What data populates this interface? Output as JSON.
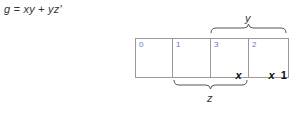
{
  "equation": "g = xy + yz'",
  "kmap": {
    "cells": [
      {
        "index": "0",
        "values": []
      },
      {
        "index": "1",
        "values": []
      },
      {
        "index": "3",
        "values": [
          "x"
        ]
      },
      {
        "index": "2",
        "values": [
          "x",
          "1"
        ]
      }
    ]
  },
  "braces": {
    "top": {
      "label": "y",
      "spans_cells": [
        "3",
        "2"
      ]
    },
    "bottom": {
      "label": "z",
      "spans_cells": [
        "1",
        "3"
      ]
    }
  },
  "colors": {
    "index_color": "#5b7fb5",
    "border_color": "#9a9a9a",
    "text_color": "#111111"
  }
}
